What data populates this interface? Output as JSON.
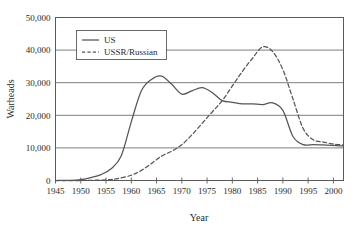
{
  "chart_data": {
    "type": "line",
    "title": "",
    "xlabel": "Year",
    "ylabel": "Warheads",
    "xlim": [
      1945,
      2002
    ],
    "ylim": [
      0,
      50000
    ],
    "grid": true,
    "legend_position": "top-left",
    "x_ticks": [
      1945,
      1950,
      1955,
      1960,
      1965,
      1970,
      1975,
      1980,
      1985,
      1990,
      1995,
      2000
    ],
    "x_tick_labels": [
      "1945",
      "1950",
      "1955",
      "1960",
      "1965",
      "1970",
      "1975",
      "1980",
      "1985",
      "1990",
      "1995",
      "2000"
    ],
    "y_ticks": [
      0,
      10000,
      20000,
      30000,
      40000,
      50000
    ],
    "y_tick_labels": [
      "0",
      "10,000",
      "20,000",
      "30,000",
      "40,000",
      "50,000"
    ],
    "series": [
      {
        "name": "US",
        "style": "solid",
        "color": "#555555",
        "x": [
          1945,
          1948,
          1950,
          1952,
          1954,
          1956,
          1958,
          1960,
          1962,
          1964,
          1966,
          1968,
          1970,
          1972,
          1974,
          1976,
          1978,
          1980,
          1982,
          1984,
          1986,
          1988,
          1990,
          1992,
          1994,
          1996,
          1998,
          2000,
          2002
        ],
        "values": [
          0,
          50,
          300,
          900,
          1800,
          3600,
          7500,
          18000,
          27500,
          31000,
          32000,
          29500,
          26500,
          27500,
          28500,
          27000,
          24500,
          24000,
          23500,
          23500,
          23300,
          23800,
          21500,
          13500,
          11000,
          11000,
          10900,
          10800,
          10600
        ]
      },
      {
        "name": "USSR/Russian",
        "style": "dashed",
        "color": "#555555",
        "x": [
          1945,
          1950,
          1955,
          1957,
          1960,
          1962,
          1964,
          1966,
          1968,
          1970,
          1972,
          1974,
          1976,
          1978,
          1980,
          1982,
          1984,
          1986,
          1988,
          1990,
          1992,
          1994,
          1996,
          1998,
          2000,
          2002
        ],
        "values": [
          0,
          0,
          200,
          500,
          1600,
          3100,
          5200,
          7500,
          9000,
          11000,
          14000,
          17500,
          21000,
          24500,
          29000,
          33500,
          37500,
          41000,
          39500,
          34000,
          25000,
          16000,
          12500,
          11800,
          11200,
          10900
        ]
      }
    ],
    "legend_entries": [
      {
        "label": "US",
        "style": "solid"
      },
      {
        "label": "USSR/Russian",
        "style": "dashed"
      }
    ]
  }
}
